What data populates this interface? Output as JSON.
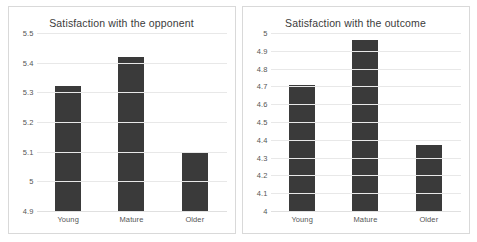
{
  "chart_data": [
    {
      "type": "bar",
      "title": "Satisfaction with the opponent",
      "categories": [
        "Young",
        "Mature",
        "Older"
      ],
      "values": [
        5.32,
        5.42,
        5.1
      ],
      "xlabel": "",
      "ylabel": "",
      "ylim": [
        4.9,
        5.5
      ],
      "yticks": [
        "5.5",
        "5.4",
        "5.3",
        "5.2",
        "5.1",
        "5",
        "4.9"
      ],
      "ytick_values": [
        5.5,
        5.4,
        5.3,
        5.2,
        5.1,
        5.0,
        4.9
      ],
      "grid": true,
      "legend": "none",
      "bar_color": "#3a3a3a"
    },
    {
      "type": "bar",
      "title": "Satisfaction with the outcome",
      "categories": [
        "Young",
        "Mature",
        "Older"
      ],
      "values": [
        4.71,
        4.96,
        4.37
      ],
      "xlabel": "",
      "ylabel": "",
      "ylim": [
        4,
        5
      ],
      "yticks": [
        "5",
        "4.9",
        "4.8",
        "4.7",
        "4.6",
        "4.5",
        "4.4",
        "4.3",
        "4.2",
        "4.1",
        "4"
      ],
      "ytick_values": [
        5.0,
        4.9,
        4.8,
        4.7,
        4.6,
        4.5,
        4.4,
        4.3,
        4.2,
        4.1,
        4.0
      ],
      "grid": true,
      "legend": "none",
      "bar_color": "#3a3a3a"
    }
  ]
}
